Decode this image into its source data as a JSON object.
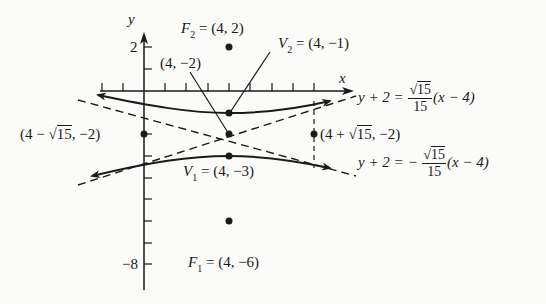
{
  "figure": {
    "type": "hyperbola-graph",
    "axes": {
      "x_label": "x",
      "y_label": "y",
      "y_tick_labels": [
        {
          "value": 2,
          "text": "2"
        },
        {
          "value": -8,
          "text": "−8"
        }
      ]
    },
    "points": {
      "F2": {
        "name": "F",
        "sub": "2",
        "coords": "(4, 2)"
      },
      "center": {
        "coords": "(4, −2)"
      },
      "V2": {
        "name": "V",
        "sub": "2",
        "coords": "(4, −1)"
      },
      "V1": {
        "name": "V",
        "sub": "1",
        "coords": "(4, −3)"
      },
      "F1": {
        "name": "F",
        "sub": "1",
        "coords": "(4, −6)"
      },
      "left_point": {
        "prefix": "(4 − ",
        "radical": "15",
        "suffix": ", −2)"
      },
      "right_point": {
        "prefix": "(4 + ",
        "radical": "15",
        "suffix": ", −2)"
      }
    },
    "asymptotes": {
      "upper": {
        "lhs": "y + 2 = ",
        "sign": "",
        "num_radical": "15",
        "den": "15",
        "rhs": "(x − 4)"
      },
      "lower": {
        "lhs": "y + 2 = ",
        "sign": "− ",
        "num_radical": "15",
        "den": "15",
        "rhs": "(x − 4)"
      }
    },
    "equals": " = ",
    "colors": {
      "ink": "#1a1a1a",
      "background": "#fbfbf9"
    }
  }
}
